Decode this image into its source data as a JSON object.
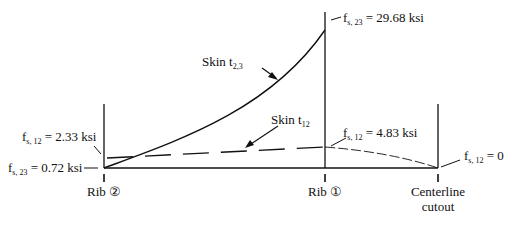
{
  "diagram": {
    "stations": [
      {
        "id": "rib2",
        "label": "Rib ②",
        "x": 104
      },
      {
        "id": "rib1",
        "label": "Rib ①",
        "x": 409
      },
      {
        "id": "centerline",
        "label_line1": "Centerline",
        "label_line2": "cutout",
        "x": 438
      }
    ],
    "curves": {
      "skin_t23": {
        "label": "Skin t",
        "subscript": "2,3",
        "style": "solid"
      },
      "skin_t12": {
        "label": "Skin t",
        "subscript": "12",
        "style": "dashed"
      }
    },
    "annotations": {
      "fs23_rib1": {
        "prefix": "f",
        "subscript": "s, 23",
        "value": " = 29.68 ksi"
      },
      "fs12_rib1": {
        "prefix": "f",
        "subscript": "s, 12",
        "value": " = 4.83 ksi"
      },
      "fs12_rib2": {
        "prefix": "f",
        "subscript": "s, 12",
        "value": " = 2.33 ksi"
      },
      "fs23_rib2": {
        "prefix": "f",
        "subscript": "s, 23",
        "value": " = 0.72 ksi"
      },
      "fs12_center": {
        "prefix": "f",
        "subscript": "s, 12",
        "value": " = 0"
      }
    },
    "footer_faint": "(in)"
  }
}
